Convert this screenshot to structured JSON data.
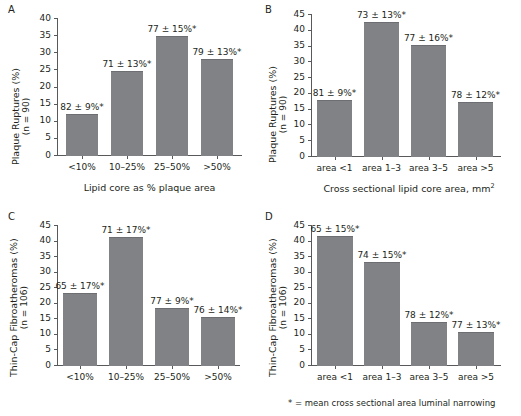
{
  "figure": {
    "footnote": "* = mean cross sectional  area luminal narrowing",
    "bar_color": "#808285",
    "axis_color": "#58595b",
    "text_color": "#231f20"
  },
  "panels": {
    "a": {
      "letter": "A",
      "ylabel_line1": "Plaque Ruptures (%)",
      "ylabel_line2": "(n = 90)",
      "xtitle": "Lipid core as % plaque area"
    },
    "b": {
      "letter": "B",
      "ylabel_line1": "Plaque Ruptures (%)",
      "ylabel_line2": "(n = 90)",
      "xtitle_pre": "Cross sectional lipid core area, mm",
      "xtitle_sup": "2"
    },
    "c": {
      "letter": "C",
      "ylabel_line1": "Thin-Cap Fibroatheromas (%)",
      "ylabel_line2": "(n = 106)",
      "xtitle": ""
    },
    "d": {
      "letter": "D",
      "ylabel_line1": "Thin-Cap Fibroatheromas (%)",
      "ylabel_line2": "(n = 106)",
      "xtitle": ""
    }
  },
  "chart_data": [
    {
      "id": "A",
      "type": "bar",
      "title": "A",
      "xlabel": "Lipid core as % plaque area",
      "ylabel": "Plaque Ruptures (%) (n = 90)",
      "ylim": [
        0,
        40
      ],
      "yticks": [
        0,
        5,
        10,
        15,
        20,
        25,
        30,
        35,
        40
      ],
      "ytick_labels": [
        "0",
        "5",
        "10",
        "15",
        "20",
        "25",
        "30",
        "35",
        "40"
      ],
      "grid": false,
      "categories": [
        "<10%",
        "10–25%",
        "25–50%",
        ">50%"
      ],
      "values": [
        12.0,
        24.5,
        34.7,
        28.0
      ],
      "annotations": [
        "82 ± 9%*",
        "71 ± 13%*",
        "77 ± 15%*",
        "79 ± 13%*"
      ]
    },
    {
      "id": "B",
      "type": "bar",
      "title": "B",
      "xlabel": "Cross sectional lipid core area, mm2",
      "ylabel": "Plaque Ruptures (%) (n = 90)",
      "ylim": [
        0,
        45
      ],
      "yticks": [
        0,
        5,
        10,
        15,
        20,
        25,
        30,
        35,
        40,
        45
      ],
      "ytick_labels": [
        "0",
        "5",
        "10",
        "15",
        "20",
        "25",
        "30",
        "35",
        "40",
        "45"
      ],
      "grid": false,
      "categories": [
        "area <1",
        "area 1–3",
        "area 3–5",
        "area >5"
      ],
      "values": [
        17.7,
        42.5,
        35.1,
        17.2
      ],
      "annotations": [
        "81 ± 9%*",
        "73 ± 13%*",
        "77 ± 16%*",
        "78 ± 12%*"
      ]
    },
    {
      "id": "C",
      "type": "bar",
      "title": "C",
      "xlabel": "",
      "ylabel": "Thin-Cap Fibroatheromas (%) (n = 106)",
      "ylim": [
        0,
        45
      ],
      "yticks": [
        0,
        5,
        10,
        15,
        20,
        25,
        30,
        35,
        40,
        45
      ],
      "ytick_labels": [
        "0",
        "5",
        "10",
        "15",
        "20",
        "25",
        "30",
        "35",
        "40",
        "45"
      ],
      "grid": false,
      "categories": [
        "<10%",
        "10–25%",
        "25–50%",
        ">50%"
      ],
      "values": [
        23.3,
        41.3,
        18.3,
        15.3
      ],
      "annotations": [
        "65 ± 17%*",
        "71 ± 17%*",
        "77 ± 9%*",
        "76 ± 14%*"
      ]
    },
    {
      "id": "D",
      "type": "bar",
      "title": "D",
      "xlabel": "",
      "ylabel": "Thin-Cap Fibroatheromas (%) (n = 106)",
      "ylim": [
        0,
        45
      ],
      "yticks": [
        0,
        5,
        10,
        15,
        20,
        25,
        30,
        35,
        40,
        45
      ],
      "ytick_labels": [
        "0",
        "5",
        "10",
        "15",
        "20",
        "25",
        "30",
        "35",
        "40",
        "45"
      ],
      "grid": false,
      "categories": [
        "area <1",
        "area 1–3",
        "area 3–5",
        "area >5"
      ],
      "values": [
        41.4,
        33.0,
        13.8,
        10.6
      ],
      "annotations": [
        "65 ± 15%*",
        "74 ± 15%*",
        "78 ± 12%*",
        "77 ± 13%*"
      ]
    }
  ]
}
